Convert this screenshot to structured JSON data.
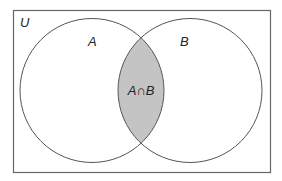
{
  "diagram": {
    "type": "venn",
    "universe": {
      "label": "U",
      "rect": {
        "x": 13.5,
        "y": 10.5,
        "width": 257,
        "height": 162
      }
    },
    "sets": [
      {
        "id": "A",
        "label": "A",
        "cx": 92,
        "cy": 90.5,
        "r": 72
      },
      {
        "id": "B",
        "label": "B",
        "cx": 190,
        "cy": 90.5,
        "r": 72
      }
    ],
    "intersection": {
      "label": "A∩B",
      "shaded": true
    },
    "colors": {
      "stroke": "#555555",
      "shade": "#c4c4c4",
      "background": "#ffffff",
      "text": "#222222"
    }
  }
}
